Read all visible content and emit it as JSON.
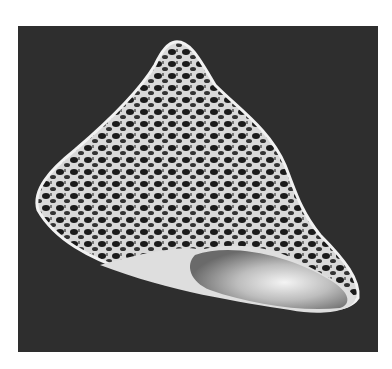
{
  "image": {
    "subject": "top shell (sea snail shell) photographed on dark background",
    "alt": "Conical spotted sea shell with pearly aperture on dark grey background",
    "colors": {
      "background": "#ffffff",
      "frame": "#2e2e2e",
      "shell_light": "#e8e8e8",
      "shell_dark": "#1a1a1a",
      "aperture": "#c8c8c8"
    }
  }
}
